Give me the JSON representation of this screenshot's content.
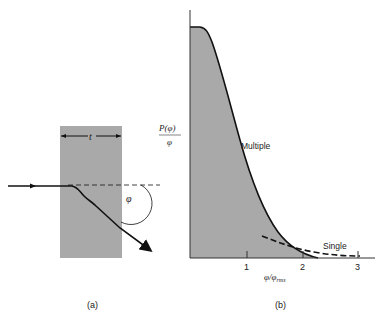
{
  "panel_a": {
    "caption": "(a)",
    "thickness_label": "t",
    "angle_label": "φ"
  },
  "panel_b": {
    "caption": "(b)",
    "y_label_num": "P(φ)",
    "y_label_den": "φ",
    "x_label_main": "φ/φ",
    "x_label_sub": "rms",
    "curve_multiple_label": "Multiple",
    "curve_single_label": "Single",
    "ticks": [
      "1",
      "2",
      "3"
    ]
  },
  "colors": {
    "fill": "#a9a9a9",
    "line": "#111111"
  }
}
